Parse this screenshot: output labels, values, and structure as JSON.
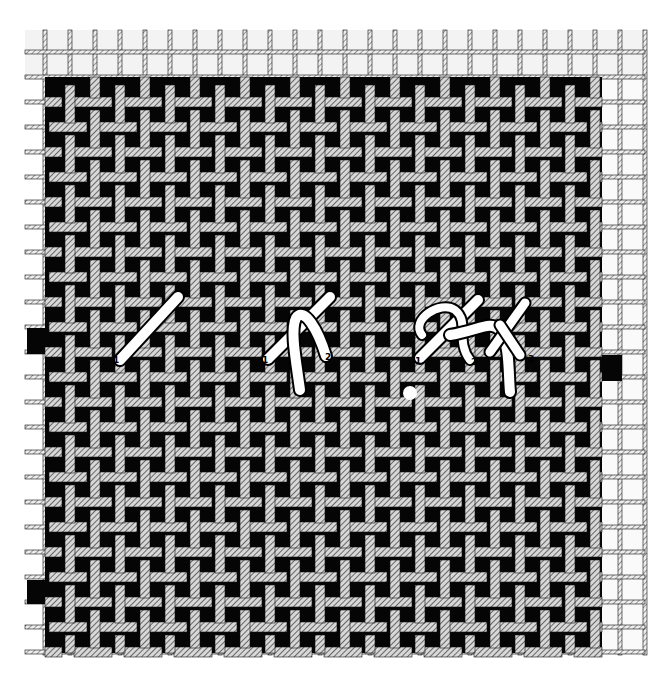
{
  "figure": {
    "title": "",
    "background_color": "#ffffff",
    "canvas_color": "#050505",
    "grid_fill_color": "#f0f0f0",
    "thread_color": "#ffffff",
    "weave_period_px": 50,
    "thread_spacing_px": 25
  },
  "stitches": [
    {
      "id": "stitch-1",
      "name": "single diagonal stitch",
      "labels": [
        "1"
      ]
    },
    {
      "id": "stitch-2",
      "name": "crossed stitch step",
      "labels": [
        "1",
        "2"
      ]
    },
    {
      "id": "stitch-3",
      "name": "knotted stitch step",
      "labels": [
        "1",
        "2",
        "3"
      ]
    }
  ],
  "markers": [
    {
      "id": "start-dot",
      "name": "needle entry point"
    }
  ]
}
